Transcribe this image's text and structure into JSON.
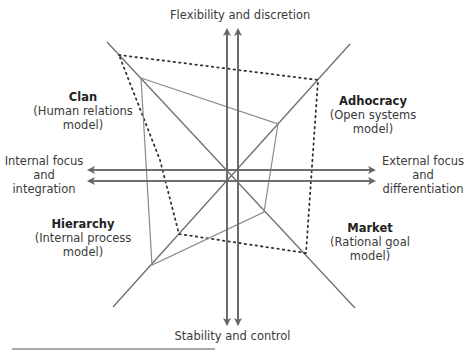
{
  "axes": {
    "top": "Flexibility and discretion",
    "bottom": "Stability and control",
    "left": [
      "Internal focus",
      "and",
      "integration"
    ],
    "right": [
      "External focus",
      "and",
      "differentiation"
    ]
  },
  "quadrants": {
    "clan": {
      "name": "Clan",
      "sub": [
        "(Human relations",
        "model)"
      ]
    },
    "adhocracy": {
      "name": "Adhocracy",
      "sub": [
        "(Open systems",
        "model)"
      ]
    },
    "hierarchy": {
      "name": "Hierarchy",
      "sub": [
        "(Internal process",
        "model)"
      ]
    },
    "market": {
      "name": "Market",
      "sub": [
        "(Rational goal",
        "model)"
      ]
    }
  },
  "colors": {
    "axis": "#666666",
    "profile": "#8a8a8a",
    "dotted": "#333333",
    "text": "#3a3a3a"
  },
  "profiles": {
    "dotted_relative": {
      "clan": 0.92,
      "adhocracy": 0.84,
      "market": 0.74,
      "hierarchy": 0.52
    },
    "solid_relative": {
      "clan": 0.72,
      "adhocracy": 0.42,
      "market": 0.34,
      "hierarchy": 0.6
    }
  }
}
